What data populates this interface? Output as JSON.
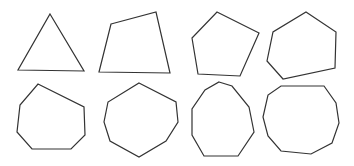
{
  "diagram": {
    "title": "",
    "background": "#ffffff",
    "stroke_color": "#333333",
    "layout": {
      "rows": 2,
      "columns": 4
    },
    "shapes": [
      {
        "name": "triangle",
        "sides": 3,
        "row": 0,
        "col": 0,
        "points": [
          [
            50,
            14
          ],
          [
            84,
            71
          ],
          [
            18,
            70
          ]
        ]
      },
      {
        "name": "quadrilateral",
        "sides": 4,
        "row": 0,
        "col": 1,
        "points": [
          [
            111,
            24
          ],
          [
            156,
            12
          ],
          [
            170,
            73
          ],
          [
            99,
            72
          ]
        ]
      },
      {
        "name": "pentagon",
        "sides": 5,
        "row": 0,
        "col": 2,
        "points": [
          [
            217,
            12
          ],
          [
            259,
            33
          ],
          [
            240,
            76
          ],
          [
            198,
            74
          ],
          [
            192,
            38
          ]
        ]
      },
      {
        "name": "hexagon",
        "sides": 6,
        "row": 0,
        "col": 3,
        "points": [
          [
            306,
            12
          ],
          [
            336,
            32
          ],
          [
            335,
            68
          ],
          [
            283,
            79
          ],
          [
            267,
            61
          ],
          [
            273,
            32
          ]
        ]
      },
      {
        "name": "heptagon",
        "sides": 7,
        "row": 1,
        "col": 0,
        "points": [
          [
            38,
            84
          ],
          [
            84,
            107
          ],
          [
            85,
            135
          ],
          [
            71,
            149
          ],
          [
            32,
            149
          ],
          [
            17,
            132
          ],
          [
            20,
            105
          ]
        ]
      },
      {
        "name": "octagon",
        "sides": 8,
        "row": 1,
        "col": 1,
        "points": [
          [
            139,
            83
          ],
          [
            176,
            102
          ],
          [
            178,
            122
          ],
          [
            166,
            141
          ],
          [
            139,
            157
          ],
          [
            110,
            141
          ],
          [
            104,
            122
          ],
          [
            108,
            102
          ]
        ]
      },
      {
        "name": "nonagon",
        "sides": 9,
        "row": 1,
        "col": 2,
        "points": [
          [
            219,
            82
          ],
          [
            232,
            86
          ],
          [
            249,
            107
          ],
          [
            254,
            132
          ],
          [
            238,
            156
          ],
          [
            204,
            156
          ],
          [
            192,
            135
          ],
          [
            192,
            109
          ],
          [
            205,
            90
          ]
        ]
      },
      {
        "name": "decagon",
        "sides": 10,
        "row": 1,
        "col": 3,
        "points": [
          [
            281,
            86
          ],
          [
            324,
            86
          ],
          [
            336,
            103
          ],
          [
            339,
            123
          ],
          [
            332,
            143
          ],
          [
            311,
            154
          ],
          [
            281,
            151
          ],
          [
            268,
            136
          ],
          [
            263,
            117
          ],
          [
            268,
            95
          ]
        ]
      }
    ]
  }
}
